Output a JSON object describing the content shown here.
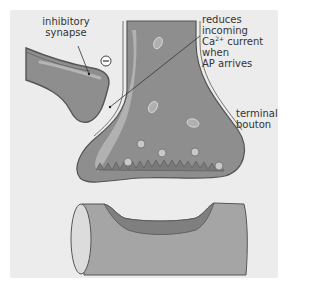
{
  "labels": {
    "inhibitory_synapse_line1": "inhibitory",
    "inhibitory_synapse_line2": "synapse",
    "reduces_line1": "reduces incoming",
    "reduces_line2_pre": "Ca",
    "reduces_line2_sup": "2+",
    "reduces_line2_post": " current when",
    "reduces_line3": "AP arrives",
    "terminal_line1": "terminal",
    "terminal_line2": "bouton"
  },
  "symbols": {
    "inhibitory_sign": "−"
  },
  "colors": {
    "panel_bg": "#ececec",
    "neuron_fill": "#8e8e8e",
    "neuron_highlight": "#b5b5b5",
    "outline": "#555555",
    "dendrite_fill": "#a5a5a5",
    "dendrite_groove": "#7f7f7f",
    "vesicle_fill": "#c8c8c8"
  }
}
